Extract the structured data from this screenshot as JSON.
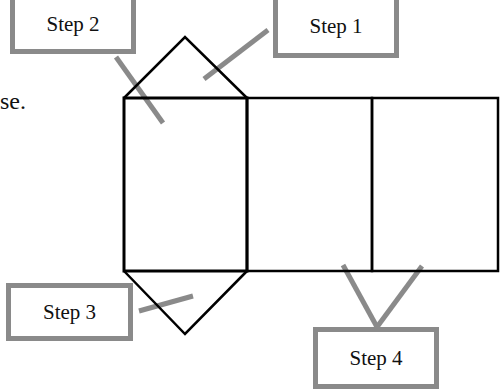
{
  "diagram": {
    "type": "net of triangular prism",
    "text_fragment": "se.",
    "labels": [
      {
        "id": "step1",
        "text": "Step 1"
      },
      {
        "id": "step2",
        "text": "Step 2"
      },
      {
        "id": "step3",
        "text": "Step 3"
      },
      {
        "id": "step4",
        "text": "Step 4"
      }
    ],
    "colors": {
      "outline": "#000000",
      "leader": "#8a8a8a",
      "box_border": "#8a8a8a"
    }
  }
}
